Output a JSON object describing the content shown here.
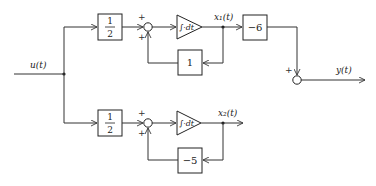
{
  "diagram": {
    "input_label": "u(t)",
    "output_label": "y(t)",
    "upper_branch": {
      "gain_numerator": "1",
      "gain_denominator": "2",
      "sum_signs": [
        "+",
        "+"
      ],
      "integrator_label": "∫·dt",
      "state_label": "x₁(t)",
      "feedback_gain": "1",
      "output_gain": "−6"
    },
    "lower_branch": {
      "gain_numerator": "1",
      "gain_denominator": "2",
      "sum_signs": [
        "+",
        "+"
      ],
      "integrator_label": "∫·dt",
      "state_label": "x₂(t)",
      "feedback_gain": "−5"
    },
    "output_sum_sign": "+"
  }
}
